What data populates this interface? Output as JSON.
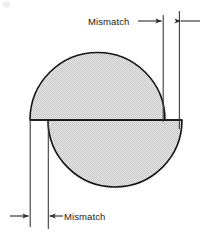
{
  "figure": {
    "title": "",
    "background_color": "#ffffff",
    "outline_color": "#141414",
    "fill_color": "#d9d9d9",
    "dimension_line_color": "#3a3a3a",
    "labels": {
      "top_mismatch": "Mismatch",
      "bottom_mismatch": "Mismatch"
    },
    "shapes": [
      {
        "name": "upper-semicircle",
        "orientation": "dome-up",
        "center": [
          97,
          120
        ],
        "radius": 67,
        "x_extent": [
          30,
          165
        ],
        "apex_y": 56
      },
      {
        "name": "lower-semicircle",
        "orientation": "dome-down",
        "center": [
          115,
          120
        ],
        "radius": 67,
        "x_extent": [
          48,
          182
        ],
        "apex_y": 187
      }
    ],
    "dimensions": [
      {
        "name": "top-mismatch-dimension",
        "label": "Mismatch",
        "from_x": 163,
        "to_x": 179,
        "y": 21,
        "measures": "horizontal offset between right edges of the two semicircles"
      },
      {
        "name": "bottom-mismatch-dimension",
        "label": "Mismatch",
        "from_x": 30,
        "to_x": 48,
        "y": 216,
        "measures": "horizontal offset between left edges of the two semicircles"
      }
    ]
  }
}
